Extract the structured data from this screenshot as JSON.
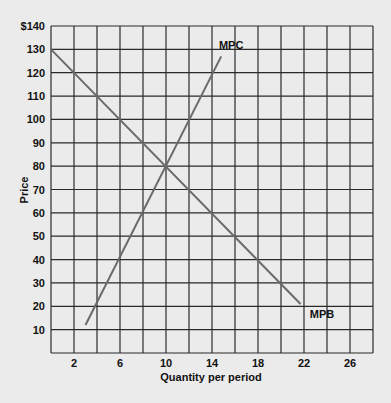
{
  "chart_data": {
    "type": "line",
    "title": "",
    "xlabel": "Quantity per period",
    "ylabel": "Price",
    "xlim": [
      0,
      28
    ],
    "ylim": [
      0,
      140
    ],
    "x_ticks": [
      2,
      6,
      10,
      14,
      18,
      22,
      26
    ],
    "y_ticks": [
      "10",
      "20",
      "30",
      "40",
      "50",
      "60",
      "70",
      "80",
      "90",
      "100",
      "110",
      "120",
      "130",
      "$140"
    ],
    "grid": true,
    "x_grid_step": 2,
    "y_grid_step": 10,
    "series": [
      {
        "name": "MPC",
        "points": [
          [
            3,
            12
          ],
          [
            14.8,
            127
          ]
        ],
        "color": "#6a6a6a"
      },
      {
        "name": "MPB",
        "points": [
          [
            0,
            130
          ],
          [
            21.7,
            21
          ]
        ],
        "color": "#6a6a6a"
      }
    ],
    "annotations": [
      {
        "text": "MPC",
        "x": 14.6,
        "y": 130
      },
      {
        "text": "MPB",
        "x": 22.5,
        "y": 15
      }
    ],
    "equilibrium": {
      "x": 10,
      "y": 80
    }
  },
  "colors": {
    "background": "#ebebeb",
    "grid": "#2a2a2a",
    "curve": "#6a6a6a"
  }
}
